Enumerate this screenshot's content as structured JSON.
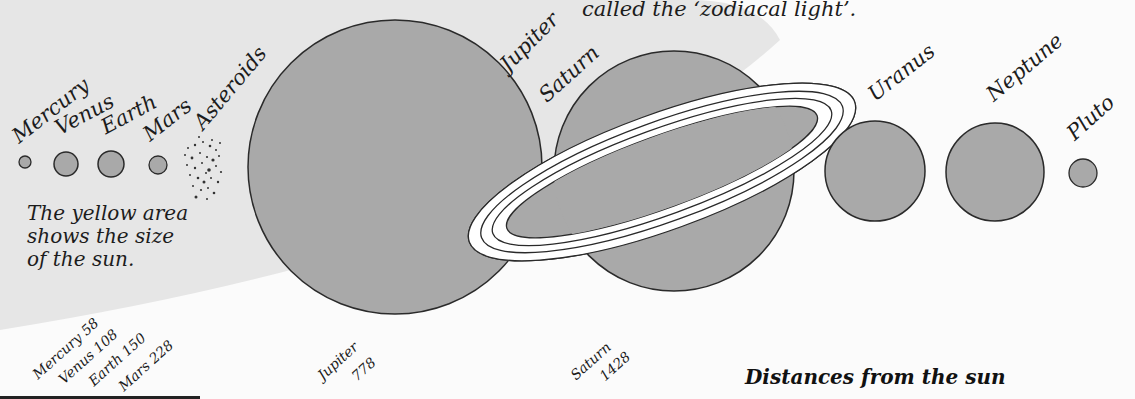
{
  "header": {
    "caption_line": "called the ‘zodiacal light’."
  },
  "sun_note": {
    "lines": [
      "The yellow area",
      "shows the size",
      "of the sun."
    ]
  },
  "planets": [
    {
      "name": "Mercury",
      "cx": 25,
      "cy": 162,
      "r": 6
    },
    {
      "name": "Venus",
      "cx": 66,
      "cy": 164,
      "r": 12
    },
    {
      "name": "Earth",
      "cx": 111,
      "cy": 164,
      "r": 13
    },
    {
      "name": "Mars",
      "cx": 158,
      "cy": 165,
      "r": 9
    },
    {
      "name": "Asteroids"
    },
    {
      "name": "Jupiter",
      "cx": 395,
      "cy": 167,
      "r": 147
    },
    {
      "name": "Saturn",
      "cx": 674,
      "cy": 171,
      "r": 120
    },
    {
      "name": "Uranus",
      "cx": 875,
      "cy": 171,
      "r": 50
    },
    {
      "name": "Neptune",
      "cx": 995,
      "cy": 172,
      "r": 49
    },
    {
      "name": "Pluto",
      "cx": 1083,
      "cy": 173,
      "r": 14
    }
  ],
  "distances": {
    "title": "Distances from the sun",
    "items": [
      {
        "label": "Mercury 58"
      },
      {
        "label": "Venus 108"
      },
      {
        "label": "Earth 150"
      },
      {
        "label": "Mars 228"
      },
      {
        "label": "Jupiter"
      },
      {
        "label": "778"
      },
      {
        "label": "Saturn"
      },
      {
        "label": "1428"
      }
    ]
  },
  "colors": {
    "planet_fill": "#a9a9a9",
    "outline": "#2a2a2a",
    "sun_area": "#e4e4e4",
    "background": "#fbfbfb"
  }
}
